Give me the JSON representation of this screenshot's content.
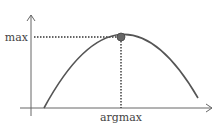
{
  "diagram": {
    "y_label": "max",
    "x_label": "argmax",
    "colors": {
      "axis": "#666666",
      "curve": "#555555",
      "dot": "#666666",
      "dotted": "#333333",
      "text": "#444444"
    }
  }
}
